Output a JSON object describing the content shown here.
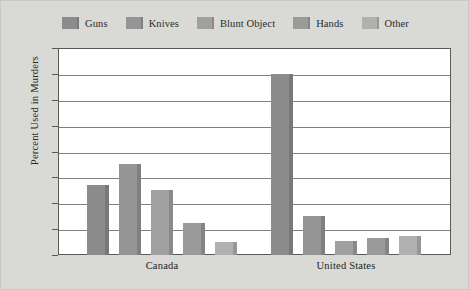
{
  "legend": {
    "position": "top",
    "items": [
      {
        "label": "Guns",
        "color": "#8c8c8c"
      },
      {
        "label": "Knives",
        "color": "#959595"
      },
      {
        "label": "Blunt Object",
        "color": "#a0a0a0"
      },
      {
        "label": "Hands",
        "color": "#9a9a9a"
      },
      {
        "label": "Other",
        "color": "#b0b0b0"
      }
    ]
  },
  "axes": {
    "ylabel": "Percent Used in Murders",
    "yticks": [
      "0",
      "10",
      "20",
      "30",
      "40",
      "50",
      "60",
      "70",
      "80"
    ],
    "xticklabels": [
      "Canada",
      "United States"
    ]
  },
  "chart_data": {
    "type": "bar",
    "title": "",
    "xlabel": "",
    "ylabel": "Percent Used in Murders",
    "categories": [
      "Canada",
      "United States"
    ],
    "ylim": [
      0,
      80
    ],
    "ytick_step": 10,
    "grid": true,
    "legend_position": "top",
    "series": [
      {
        "name": "Guns",
        "color": "#8c8c8c",
        "values": [
          27,
          70
        ]
      },
      {
        "name": "Knives",
        "color": "#959595",
        "values": [
          35,
          15
        ]
      },
      {
        "name": "Blunt Object",
        "color": "#a0a0a0",
        "values": [
          25,
          5.5
        ]
      },
      {
        "name": "Hands",
        "color": "#9a9a9a",
        "values": [
          12.5,
          6.5
        ]
      },
      {
        "name": "Other",
        "color": "#b0b0b0",
        "values": [
          5,
          7.5
        ]
      }
    ]
  },
  "style": {
    "figure_background": "#d9d9d5",
    "plot_background": "#ffffff",
    "gridline_color": "#808080",
    "axis_color": "#5a5a5a",
    "text_color": "#1f1f1f"
  }
}
